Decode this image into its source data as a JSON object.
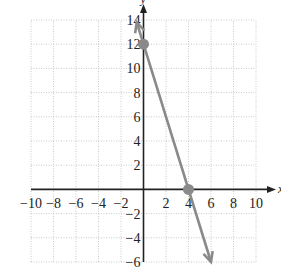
{
  "chart_data": {
    "type": "line",
    "title": "",
    "xlabel": "x",
    "ylabel": "y",
    "xlim": [
      -10,
      10
    ],
    "ylim": [
      -6,
      14
    ],
    "grid": true,
    "grid_step": 2,
    "x_ticks": [
      -10,
      -8,
      -6,
      -4,
      -2,
      2,
      4,
      6,
      8,
      10
    ],
    "x_tick_labels": [
      "−10",
      "−8",
      "−6",
      "−4",
      "−2",
      "2",
      "4",
      "6",
      "8",
      "10"
    ],
    "y_ticks": [
      -6,
      -4,
      -2,
      2,
      4,
      6,
      8,
      10,
      12,
      14
    ],
    "y_tick_labels": [
      "−6",
      "−4",
      "−2",
      "2",
      "4",
      "6",
      "8",
      "10",
      "12",
      "14"
    ],
    "series": [
      {
        "name": "line",
        "equation": "y = -3x + 12",
        "x": [
          -0.6,
          6
        ],
        "y": [
          13.8,
          -6
        ],
        "arrows": "both",
        "color": "#8a8a8a"
      }
    ],
    "marked_points": [
      {
        "x": 0,
        "y": 12,
        "label": "y-intercept"
      },
      {
        "x": 4,
        "y": 0,
        "label": "x-intercept"
      }
    ]
  }
}
